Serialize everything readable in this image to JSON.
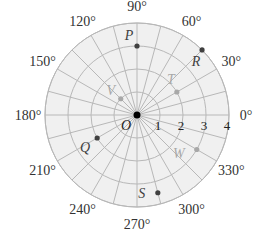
{
  "diagram": {
    "type": "polar-grid",
    "center": {
      "x": 137,
      "y": 115
    },
    "ring_px": 23,
    "rings": 4,
    "spoke_step_deg": 15,
    "colors": {
      "background": "#f0f0f0",
      "grid": "#b8b8b8",
      "dark_point": "#404040",
      "light_point": "#a8a8a8",
      "origin": "#000000"
    },
    "origin_label": "O",
    "radial_labels": [
      "1",
      "2",
      "3",
      "4"
    ],
    "angle_labels": [
      {
        "deg": 0,
        "text": "0°"
      },
      {
        "deg": 30,
        "text": "30°"
      },
      {
        "deg": 60,
        "text": "60°"
      },
      {
        "deg": 90,
        "text": "90°"
      },
      {
        "deg": 120,
        "text": "120°"
      },
      {
        "deg": 150,
        "text": "150°"
      },
      {
        "deg": 180,
        "text": "180°"
      },
      {
        "deg": 210,
        "text": "210°"
      },
      {
        "deg": 240,
        "text": "240°"
      },
      {
        "deg": 270,
        "text": "270°"
      },
      {
        "deg": 300,
        "text": "300°"
      },
      {
        "deg": 330,
        "text": "330°"
      }
    ],
    "points": [
      {
        "name": "P",
        "r": 3,
        "deg": 90,
        "shade": "dark"
      },
      {
        "name": "R",
        "r": 4,
        "deg": 45,
        "shade": "dark"
      },
      {
        "name": "T",
        "r": 2,
        "deg": 30,
        "shade": "light"
      },
      {
        "name": "V",
        "r": 1,
        "deg": 135,
        "shade": "light"
      },
      {
        "name": "Q",
        "r": 2,
        "deg": 210,
        "shade": "dark"
      },
      {
        "name": "W",
        "r": 3,
        "deg": 330,
        "shade": "light"
      },
      {
        "name": "S",
        "r": 3.5,
        "deg": 285,
        "shade": "dark"
      }
    ]
  }
}
